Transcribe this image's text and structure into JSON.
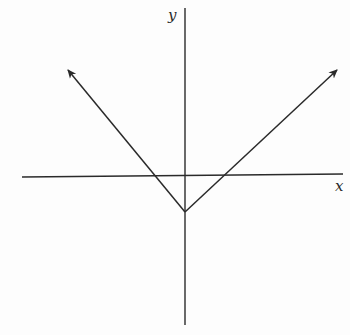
{
  "diagram": {
    "type": "coordinate-graph",
    "colors": {
      "background": "#fdfdfd",
      "stroke": "#2a2a2a"
    },
    "axes": {
      "x_label": "x",
      "y_label": "y",
      "x_axis": {
        "x1": 22,
        "y1": 177,
        "x2": 343,
        "y2": 174
      },
      "y_axis": {
        "x1": 185,
        "y1": 8,
        "x2": 185,
        "y2": 325
      }
    },
    "graph": {
      "vertex": {
        "x": 185,
        "y": 212
      },
      "left_ray_end": {
        "x": 68,
        "y": 70
      },
      "right_ray_end": {
        "x": 337,
        "y": 70
      },
      "left_ray_arrow": true,
      "right_ray_arrow": true,
      "x_intercepts": [
        {
          "x": 155,
          "y": 176
        },
        {
          "x": 227,
          "y": 175
        }
      ]
    }
  }
}
